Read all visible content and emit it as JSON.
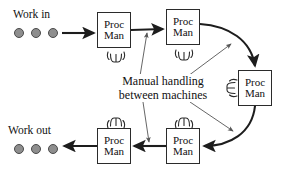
{
  "diagram": {
    "callout": {
      "line1": "Manual handling",
      "line2": "between machines"
    },
    "input_label": "Work in",
    "output_label": "Work out",
    "box_label_line1": "Proc",
    "box_label_line2": "Man",
    "boxes": [
      {
        "id": "proc-man-1",
        "line1": "Proc",
        "line2": "Man",
        "x": 97,
        "y": 12,
        "w": 34,
        "h": 36
      },
      {
        "id": "proc-man-2",
        "line1": "Proc",
        "line2": "Man",
        "x": 166,
        "y": 9,
        "w": 34,
        "h": 36
      },
      {
        "id": "proc-man-3",
        "line1": "Proc",
        "line2": "Man",
        "x": 238,
        "y": 70,
        "w": 34,
        "h": 36
      },
      {
        "id": "proc-man-4",
        "line1": "Proc",
        "line2": "Man",
        "x": 166,
        "y": 128,
        "w": 34,
        "h": 36
      },
      {
        "id": "proc-man-5",
        "line1": "Proc",
        "line2": "Man",
        "x": 97,
        "y": 128,
        "w": 34,
        "h": 36
      }
    ],
    "operator_icons": [
      {
        "id": "operator-icon-1",
        "x": 106,
        "y": 50,
        "rotate": 0
      },
      {
        "id": "operator-icon-2",
        "x": 174,
        "y": 48,
        "rotate": 0
      },
      {
        "id": "operator-icon-3",
        "x": 222,
        "y": 80,
        "rotate": 90
      },
      {
        "id": "operator-icon-4",
        "x": 174,
        "y": 112,
        "rotate": 180
      },
      {
        "id": "operator-icon-5",
        "x": 106,
        "y": 112,
        "rotate": 180
      }
    ],
    "work_in_dots": [
      {
        "x": 14,
        "y": 28
      },
      {
        "x": 31,
        "y": 28
      },
      {
        "x": 48,
        "y": 28
      }
    ],
    "work_out_dots": [
      {
        "x": 14,
        "y": 144
      },
      {
        "x": 31,
        "y": 144
      },
      {
        "x": 48,
        "y": 144
      }
    ],
    "colors": {
      "stroke": "#2b2b2b",
      "dot_fill": "#8e8e8e",
      "dot_stroke": "#4a4a4a",
      "leader": "#555555",
      "background": "#ffffff"
    }
  }
}
